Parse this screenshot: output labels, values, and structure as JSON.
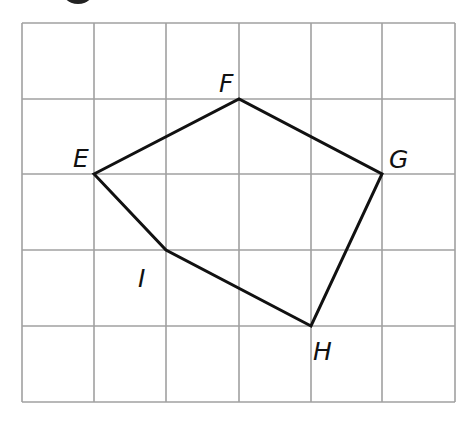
{
  "diagram": {
    "type": "polygon-on-grid",
    "grid": {
      "columns": 6,
      "rows": 5,
      "x_lines": [
        22,
        94,
        166,
        239,
        311,
        382,
        455
      ],
      "y_lines": [
        23,
        99,
        174,
        250,
        326,
        402
      ],
      "line_color": "#a0a0a0"
    },
    "polygon": {
      "stroke": "#111111",
      "vertices": [
        {
          "name": "E",
          "grid": [
            1,
            2
          ],
          "px": [
            94,
            174
          ],
          "label_pos": [
            73,
            167
          ]
        },
        {
          "name": "F",
          "grid": [
            3,
            1
          ],
          "px": [
            239,
            99
          ],
          "label_pos": [
            219,
            92
          ]
        },
        {
          "name": "G",
          "grid": [
            5,
            2
          ],
          "px": [
            382,
            174
          ],
          "label_pos": [
            389,
            168
          ]
        },
        {
          "name": "H",
          "grid": [
            4,
            4
          ],
          "px": [
            311,
            326
          ],
          "label_pos": [
            313,
            360
          ]
        },
        {
          "name": "I",
          "grid": [
            2,
            3
          ],
          "px": [
            166,
            250
          ],
          "label_pos": [
            138,
            287
          ]
        }
      ],
      "order": [
        "E",
        "F",
        "G",
        "H",
        "I"
      ]
    },
    "marker": {
      "shape": "partial-black-circle",
      "cx": 78,
      "cy": -14,
      "r": 18,
      "color": "#222222"
    }
  }
}
